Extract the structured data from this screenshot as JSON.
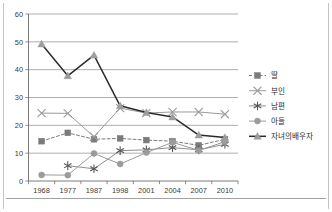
{
  "chart_data": {
    "type": "line",
    "title": "",
    "subtitle": "",
    "xlabel": "",
    "ylabel": "",
    "categories": [
      "1968",
      "1977",
      "1987",
      "1998",
      "2001",
      "2004",
      "2007",
      "2010"
    ],
    "ylim": [
      0,
      60
    ],
    "yticks": [
      0,
      10,
      20,
      30,
      40,
      50,
      60
    ],
    "ytick_labels": [
      "0",
      "10",
      "20",
      "30",
      "40",
      "50",
      "60"
    ],
    "grid": "horizontal",
    "legend_position": "right",
    "series": [
      {
        "name": "딸",
        "marker": "square",
        "linestyle": "dashed",
        "color": "#7b7b7b",
        "values": [
          14.3,
          17.3,
          15.0,
          15.3,
          14.7,
          14.3,
          12.8,
          15.0
        ]
      },
      {
        "name": "부인",
        "marker": "x",
        "linestyle": "solid",
        "color": "#9a9a9a",
        "values": [
          24.4,
          24.3,
          15.9,
          26.2,
          24.4,
          24.8,
          24.8,
          24.0
        ]
      },
      {
        "name": "남편",
        "marker": "asterisk",
        "linestyle": "solid",
        "color": "#8f8f8f",
        "values": [
          null,
          5.5,
          4.4,
          10.9,
          11.2,
          12.0,
          11.2,
          13.2
        ]
      },
      {
        "name": "아들",
        "marker": "circle",
        "linestyle": "solid",
        "color": "#9b9b9b",
        "values": [
          2.2,
          2.1,
          9.9,
          6.1,
          10.2,
          13.9,
          11.0,
          14.1
        ]
      },
      {
        "name": "자녀의배우자",
        "marker": "triangle",
        "linestyle": "solid",
        "color": "#2b2b2b",
        "values": [
          49.2,
          37.8,
          45.2,
          27.0,
          24.6,
          23.0,
          16.5,
          15.6
        ]
      }
    ]
  },
  "legend": {
    "entries": [
      {
        "label": "딸"
      },
      {
        "label": "부인"
      },
      {
        "label": "남편"
      },
      {
        "label": "아들"
      },
      {
        "label": "자녀의배우자"
      }
    ]
  },
  "colors": {
    "series_daughter": "#7b7b7b",
    "series_wife": "#9a9a9a",
    "series_husband": "#8f8f8f",
    "series_son": "#9b9b9b",
    "series_child_spouse": "#2b2b2b",
    "grid": "#8c8c8c",
    "axis": "#6e6e6e",
    "text": "#3a3a3a",
    "background": "#ffffff"
  }
}
